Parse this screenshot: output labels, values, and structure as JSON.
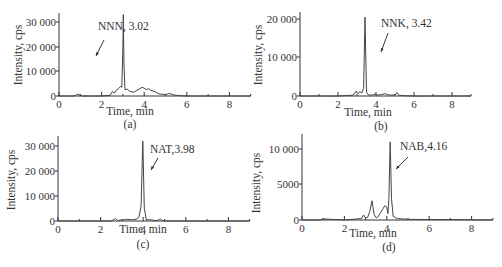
{
  "chart_data": [
    {
      "type": "line",
      "panel_label": "(a)",
      "annotation": "NNN, 3.02",
      "xlabel": "Time, min",
      "ylabel": "Intensity, cps",
      "xlim": [
        0,
        9
      ],
      "ylim": [
        0,
        33000
      ],
      "x_ticks": [
        "0",
        "2",
        "4",
        "6",
        "8"
      ],
      "y_ticks": [
        "0",
        "10 000",
        "20 000",
        "30 000"
      ],
      "grid": false,
      "peak": {
        "x": 3.02,
        "y": 33000
      },
      "series": [
        {
          "name": "NNN",
          "x": [
            0,
            0.7,
            0.9,
            1.1,
            2.0,
            2.4,
            2.5,
            2.6,
            2.7,
            2.8,
            2.9,
            2.95,
            3.0,
            3.02,
            3.05,
            3.1,
            3.2,
            3.3,
            3.5,
            3.7,
            3.9,
            4.0,
            4.1,
            4.2,
            4.3,
            4.5,
            4.7,
            5.0,
            5.2,
            5.4,
            5.6,
            6.0,
            7.0,
            8.0,
            9.0
          ],
          "values": [
            0,
            0,
            700,
            0,
            0,
            300,
            1800,
            1200,
            2500,
            3000,
            4000,
            3500,
            20000,
            33000,
            12000,
            2500,
            2800,
            2000,
            1500,
            2500,
            3500,
            3200,
            2600,
            3000,
            2300,
            1800,
            800,
            600,
            1000,
            400,
            200,
            0,
            0,
            0,
            0
          ]
        }
      ]
    },
    {
      "type": "line",
      "panel_label": "(b)",
      "annotation": "NNK, 3.42",
      "xlabel": "Time, min",
      "ylabel": "Intensity, cps",
      "xlim": [
        0,
        9
      ],
      "ylim": [
        0,
        21000
      ],
      "x_ticks": [
        "0",
        "2",
        "4",
        "6",
        "8"
      ],
      "y_ticks": [
        "0",
        "10 000",
        "20 000"
      ],
      "grid": false,
      "peak": {
        "x": 3.42,
        "y": 20500
      },
      "series": [
        {
          "name": "NNK",
          "x": [
            0,
            2.0,
            2.8,
            2.95,
            3.05,
            3.15,
            3.25,
            3.35,
            3.42,
            3.5,
            3.6,
            3.8,
            3.95,
            4.1,
            4.3,
            4.5,
            4.7,
            5.0,
            5.1,
            5.2,
            5.4,
            6.0,
            9.0
          ],
          "values": [
            0,
            0,
            200,
            1300,
            600,
            1100,
            800,
            2000,
            20500,
            1000,
            300,
            200,
            500,
            200,
            400,
            600,
            200,
            300,
            900,
            200,
            100,
            0,
            0
          ]
        }
      ]
    },
    {
      "type": "line",
      "panel_label": "(c)",
      "annotation": "NAT,3.98",
      "xlabel": "Time, min",
      "ylabel": "Intensity, cps",
      "xlim": [
        0,
        9
      ],
      "ylim": [
        0,
        33000
      ],
      "x_ticks": [
        "0",
        "2",
        "4",
        "6",
        "8"
      ],
      "y_ticks": [
        "0",
        "10 000",
        "20 000",
        "30 000"
      ],
      "grid": false,
      "peak": {
        "x": 3.98,
        "y": 32000
      },
      "series": [
        {
          "name": "NAT",
          "x": [
            0,
            2.5,
            2.7,
            2.8,
            3.0,
            3.2,
            3.5,
            3.7,
            3.8,
            3.9,
            3.98,
            4.05,
            4.15,
            4.3,
            4.5,
            4.7,
            4.8,
            4.9,
            5.1,
            9.0
          ],
          "values": [
            0,
            0,
            1000,
            200,
            400,
            700,
            500,
            800,
            1500,
            6000,
            32000,
            5000,
            400,
            600,
            200,
            300,
            900,
            200,
            0,
            0
          ]
        }
      ]
    },
    {
      "type": "line",
      "panel_label": "(d)",
      "annotation": "NAB,4.16",
      "xlabel": "Time, min",
      "ylabel": "Intensity, cps",
      "xlim": [
        0,
        9
      ],
      "ylim": [
        0,
        12000
      ],
      "x_ticks": [
        "0",
        "2",
        "4",
        "6",
        "8"
      ],
      "y_ticks": [
        "0",
        "5000",
        "10 000"
      ],
      "grid": false,
      "peak": {
        "x": 4.16,
        "y": 11000
      },
      "series": [
        {
          "name": "NAB",
          "x": [
            0,
            0.8,
            1.0,
            2.0,
            2.8,
            2.9,
            3.0,
            3.1,
            3.2,
            3.3,
            3.4,
            3.5,
            3.6,
            3.7,
            3.8,
            3.9,
            4.0,
            4.05,
            4.1,
            4.16,
            4.22,
            4.3,
            4.5,
            5.0,
            6.0,
            7.0,
            9.0
          ],
          "values": [
            0,
            0,
            150,
            0,
            200,
            700,
            300,
            400,
            1200,
            2700,
            800,
            300,
            500,
            1000,
            1500,
            2000,
            1800,
            900,
            3000,
            11000,
            3000,
            500,
            200,
            100,
            50,
            50,
            0
          ]
        }
      ]
    }
  ]
}
